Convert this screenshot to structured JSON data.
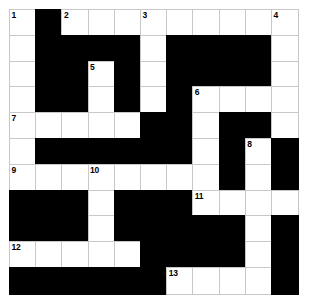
{
  "puzzle": {
    "title": "Crossword Grid",
    "rows": 11,
    "columns": 11,
    "cell_size_px": 26,
    "colors": {
      "block": "#000000",
      "open": "#ffffff",
      "gridline": "#c8c8c8",
      "border": "#9a9a9a",
      "number_text": "#000000"
    },
    "legend": {
      "open_symbol": 1,
      "block_symbol": 0
    },
    "grid": [
      [
        1,
        0,
        1,
        1,
        1,
        1,
        1,
        1,
        1,
        1,
        1
      ],
      [
        1,
        0,
        0,
        0,
        0,
        1,
        0,
        0,
        0,
        0,
        1
      ],
      [
        1,
        0,
        0,
        1,
        0,
        1,
        0,
        0,
        0,
        0,
        1
      ],
      [
        1,
        0,
        0,
        1,
        0,
        1,
        0,
        1,
        1,
        1,
        1
      ],
      [
        1,
        1,
        1,
        1,
        1,
        0,
        0,
        1,
        0,
        0,
        1
      ],
      [
        1,
        0,
        0,
        0,
        0,
        0,
        0,
        1,
        0,
        1,
        0
      ],
      [
        1,
        1,
        1,
        1,
        1,
        1,
        1,
        1,
        0,
        1,
        0
      ],
      [
        0,
        0,
        0,
        1,
        0,
        0,
        0,
        1,
        1,
        1,
        1
      ],
      [
        0,
        0,
        0,
        1,
        0,
        0,
        0,
        0,
        0,
        1,
        0
      ],
      [
        1,
        1,
        1,
        1,
        1,
        0,
        0,
        0,
        0,
        1,
        0
      ],
      [
        0,
        0,
        0,
        0,
        0,
        0,
        1,
        1,
        1,
        1,
        0
      ]
    ],
    "numbers": [
      {
        "label": "1",
        "row": 0,
        "col": 0
      },
      {
        "label": "2",
        "row": 0,
        "col": 2
      },
      {
        "label": "3",
        "row": 0,
        "col": 5
      },
      {
        "label": "4",
        "row": 0,
        "col": 10
      },
      {
        "label": "5",
        "row": 2,
        "col": 3
      },
      {
        "label": "6",
        "row": 3,
        "col": 7
      },
      {
        "label": "7",
        "row": 4,
        "col": 0
      },
      {
        "label": "8",
        "row": 5,
        "col": 9
      },
      {
        "label": "9",
        "row": 6,
        "col": 0
      },
      {
        "label": "10",
        "row": 6,
        "col": 3
      },
      {
        "label": "11",
        "row": 7,
        "col": 7
      },
      {
        "label": "12",
        "row": 9,
        "col": 0
      },
      {
        "label": "13",
        "row": 10,
        "col": 6
      }
    ],
    "letters": []
  }
}
